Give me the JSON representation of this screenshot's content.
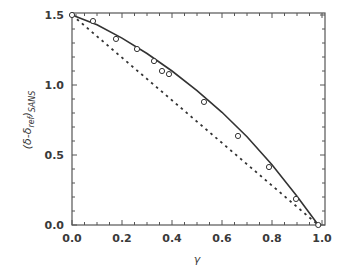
{
  "chart_data": {
    "type": "line",
    "title": "",
    "xlabel": "γ",
    "ylabel": "(δ-δ_ref)_SANS",
    "ylabel_parts": {
      "open": "(δ-δ",
      "sub1": "ref",
      "close": ")",
      "sub2": "SANS"
    },
    "xlim": [
      0.0,
      1.0
    ],
    "ylim": [
      0.0,
      1.5
    ],
    "xticks": [
      "0.0",
      "0.2",
      "0.4",
      "0.6",
      "0.8",
      "1.0"
    ],
    "yticks": [
      "0.0",
      "0.5",
      "1.0",
      "1.5"
    ],
    "grid": false,
    "legend": null,
    "series": [
      {
        "name": "data points",
        "style": "open-circle markers",
        "x": [
          0.0,
          0.084,
          0.176,
          0.26,
          0.328,
          0.36,
          0.388,
          0.528,
          0.664,
          0.788,
          0.896,
          0.985
        ],
        "y": [
          1.5,
          1.457,
          1.329,
          1.257,
          1.171,
          1.1,
          1.078,
          0.879,
          0.636,
          0.414,
          0.186,
          0.0
        ]
      },
      {
        "name": "fit (solid curve)",
        "style": "solid line",
        "x": [
          0.0,
          0.1,
          0.2,
          0.3,
          0.4,
          0.5,
          0.6,
          0.7,
          0.8,
          0.9,
          0.985
        ],
        "y": [
          1.5,
          1.43,
          1.335,
          1.225,
          1.1,
          0.96,
          0.805,
          0.63,
          0.43,
          0.205,
          0.0
        ]
      },
      {
        "name": "linear reference (dashed)",
        "style": "dashed line",
        "x": [
          0.0,
          0.985
        ],
        "y": [
          1.5,
          0.0
        ]
      }
    ]
  },
  "colors": {
    "line": "#333333",
    "axis": "#555555",
    "marker_fill": "#ffffff"
  }
}
